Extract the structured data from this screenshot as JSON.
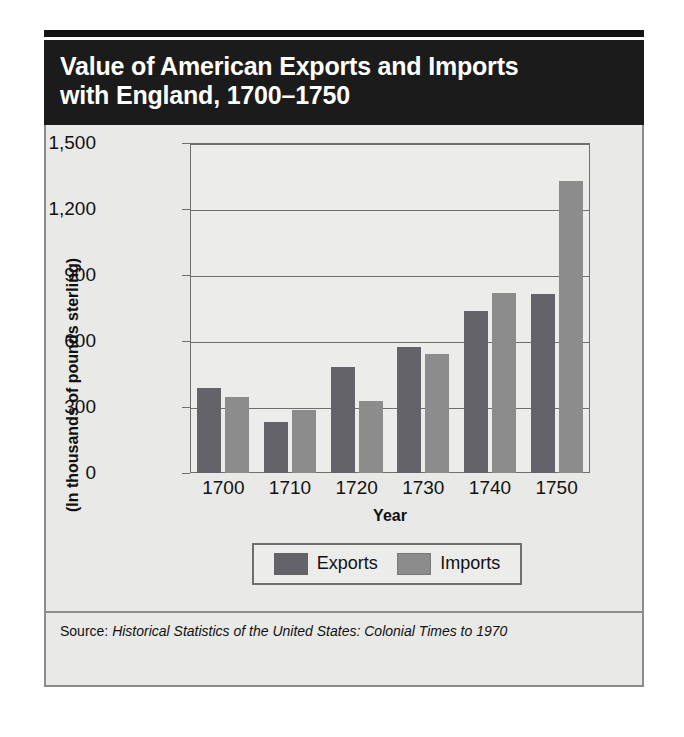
{
  "figure": {
    "title": "Value of American Exports and Imports\nwith England, 1700–1750",
    "source_prefix": "Source:",
    "source_title": "Historical Statistics of the United States: Colonial Times to 1970"
  },
  "legend": {
    "items": [
      {
        "label": "Exports",
        "color": "#636369"
      },
      {
        "label": "Imports",
        "color": "#8c8c8c"
      }
    ]
  },
  "chart_data": {
    "type": "bar",
    "title": "Value of American Exports and Imports with England, 1700–1750",
    "xlabel": "Year",
    "ylabel": "(In thousands of pounds sterling)",
    "categories": [
      "1700",
      "1710",
      "1720",
      "1730",
      "1740",
      "1750"
    ],
    "series": [
      {
        "name": "Exports",
        "color": "#636369",
        "values": [
          385,
          230,
          480,
          570,
          735,
          810
        ]
      },
      {
        "name": "Imports",
        "color": "#8c8c8c",
        "values": [
          345,
          285,
          325,
          540,
          815,
          1325
        ]
      }
    ],
    "ylim": [
      0,
      1500
    ],
    "yticks": [
      0,
      300,
      600,
      900,
      1200,
      1500
    ],
    "ytick_labels": [
      "0",
      "300",
      "600",
      "900",
      "1,200",
      "1,500"
    ],
    "grid": true,
    "legend_position": "bottom"
  }
}
